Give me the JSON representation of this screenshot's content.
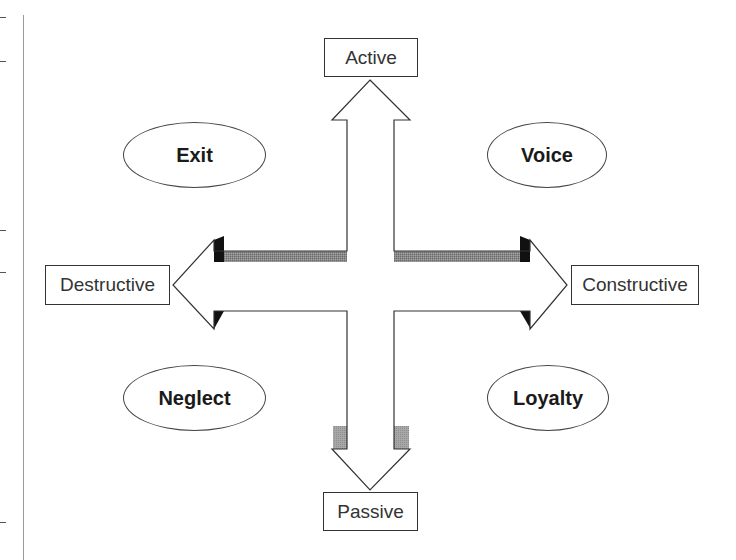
{
  "axes": {
    "top": "Active",
    "bottom": "Passive",
    "left": "Destructive",
    "right": "Constructive"
  },
  "quadrants": {
    "top_left": "Exit",
    "top_right": "Voice",
    "bottom_left": "Neglect",
    "bottom_right": "Loyalty"
  },
  "colors": {
    "outline": "#333333",
    "shade_dark": "#111111",
    "shade_gray": "#7a7a7a",
    "shade_light": "#9c9c9c"
  },
  "margin_ticks_y": [
    17,
    61,
    230,
    272,
    522
  ]
}
